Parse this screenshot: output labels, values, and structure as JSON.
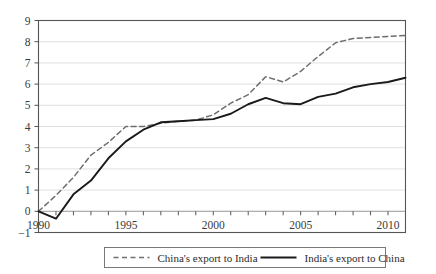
{
  "chart_data": {
    "type": "line",
    "title": "",
    "subtitle": "",
    "xlabel": "",
    "ylabel": "",
    "xlim": [
      1990,
      2011
    ],
    "ylim": [
      -1,
      9
    ],
    "yticks": [
      -1,
      0,
      1,
      2,
      3,
      4,
      5,
      6,
      7,
      8,
      9
    ],
    "ytick_labels": [
      "−1",
      "0",
      "1",
      "2",
      "3",
      "4",
      "5",
      "6",
      "7",
      "8",
      "9"
    ],
    "xticks": [
      1990,
      1991,
      1992,
      1993,
      1994,
      1995,
      1996,
      1997,
      1998,
      1999,
      2000,
      2001,
      2002,
      2003,
      2004,
      2005,
      2006,
      2007,
      2008,
      2009,
      2010,
      2011
    ],
    "xtick_labels_shown": [
      "1990",
      "1995",
      "2000",
      "2005",
      "2010"
    ],
    "xtick_labels_shown_values": [
      1990,
      1995,
      2000,
      2005,
      2010
    ],
    "grid": true,
    "grid_axis": "y",
    "legend_position": "bottom-center",
    "x": [
      1990,
      1991,
      1992,
      1993,
      1994,
      1995,
      1996,
      1997,
      1998,
      1999,
      2000,
      2001,
      2002,
      2003,
      2004,
      2005,
      2006,
      2007,
      2008,
      2009,
      2010,
      2011
    ],
    "series": [
      {
        "name": "China's export to India",
        "style": "dashed",
        "color": "#6e6e6e",
        "values": [
          0.0,
          0.75,
          1.6,
          2.65,
          3.25,
          4.0,
          4.0,
          4.15,
          4.25,
          4.3,
          4.55,
          5.1,
          5.5,
          6.35,
          6.1,
          6.6,
          7.3,
          7.95,
          8.15,
          8.2,
          8.25,
          8.3
        ]
      },
      {
        "name": "India's export to China",
        "style": "solid",
        "color": "#1a1a1a",
        "values": [
          0.0,
          -0.35,
          0.8,
          1.45,
          2.5,
          3.3,
          3.85,
          4.2,
          4.25,
          4.3,
          4.35,
          4.6,
          5.05,
          5.35,
          5.1,
          5.05,
          5.4,
          5.55,
          5.85,
          6.0,
          6.1,
          6.3
        ]
      }
    ]
  },
  "legend": {
    "items": [
      {
        "label": "China's export to India",
        "style": "dashed"
      },
      {
        "label": "India's export to China",
        "style": "solid"
      }
    ]
  }
}
